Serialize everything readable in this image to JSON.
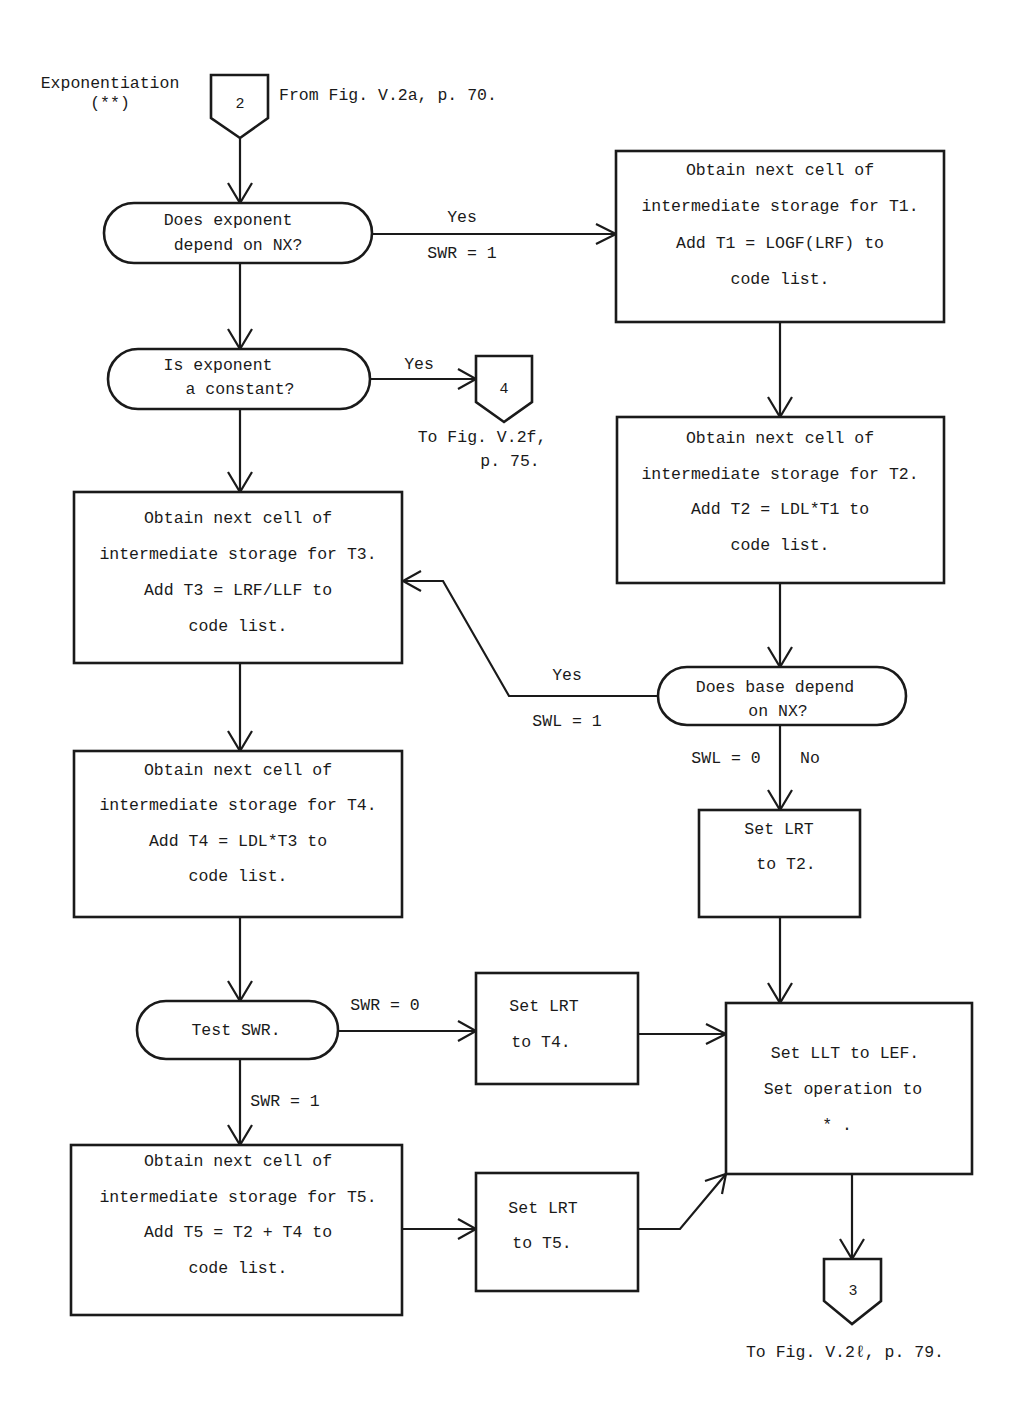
{
  "title": {
    "line1": "Exponentiation",
    "line2": "(**)"
  },
  "connectors": {
    "entry": {
      "label": "2",
      "note": "From Fig. V.2a, p. 70."
    },
    "to_constant": {
      "label": "4",
      "note_line1": "To Fig. V.2f,",
      "note_line2": "p. 75."
    },
    "exit": {
      "label": "3",
      "note": "To Fig. V.2ℓ, p. 79."
    }
  },
  "decisions": {
    "exp_depends_nx": {
      "line1": "Does exponent",
      "line2": "depend on NX?"
    },
    "exp_constant": {
      "line1": "Is exponent",
      "line2": "a constant?"
    },
    "base_depends_nx": {
      "line1": "Does base depend",
      "line2": "on NX?"
    },
    "test_swr": {
      "line1": "Test SWR."
    }
  },
  "processes": {
    "t1": {
      "lines": [
        "Obtain next cell of",
        "intermediate storage for T1.",
        "Add T1 = LOGF(LRF) to",
        "code list."
      ]
    },
    "t2": {
      "lines": [
        "Obtain next cell of",
        "intermediate storage for T2.",
        "Add T2 = LDL*T1 to",
        "code list."
      ]
    },
    "t3": {
      "lines": [
        "Obtain next cell of",
        "intermediate storage for T3.",
        "Add T3 = LRF/LLF to",
        "code list."
      ]
    },
    "t4": {
      "lines": [
        "Obtain next cell of",
        "intermediate storage for T4.",
        "Add T4 = LDL*T3 to",
        "code list."
      ]
    },
    "t5": {
      "lines": [
        "Obtain next cell of",
        "intermediate storage for T5.",
        "Add T5 = T2 + T4 to",
        "code list."
      ]
    },
    "lrt_t2": {
      "lines": [
        "Set LRT",
        "to T2."
      ]
    },
    "lrt_t4": {
      "lines": [
        "Set LRT",
        "to T4."
      ]
    },
    "lrt_t5": {
      "lines": [
        "Set LRT",
        "to T5."
      ]
    },
    "set_llt": {
      "lines": [
        "Set LLT to LEF.",
        "Set operation to",
        "* ."
      ]
    }
  },
  "edge_labels": {
    "yes_1": "Yes",
    "swr_1_top": "SWR = 1",
    "yes_2": "Yes",
    "yes_3": "Yes",
    "swl_1": "SWL = 1",
    "swl_0": "SWL = 0",
    "no_1": "No",
    "swr_0": "SWR = 0",
    "swr_1_bottom": "SWR = 1"
  }
}
